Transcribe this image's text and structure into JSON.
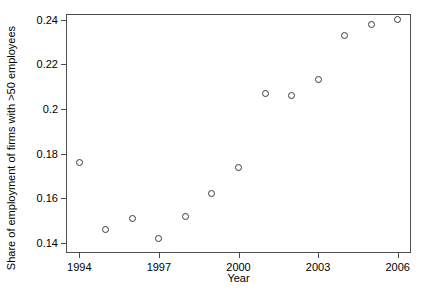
{
  "chart_data": {
    "type": "scatter",
    "title": "",
    "xlabel": "Year",
    "ylabel": "Share of employment of firms with >50 employees",
    "x": [
      1994,
      1995,
      1996,
      1997,
      1998,
      1999,
      2000,
      2001,
      2002,
      2003,
      2004,
      2005,
      2006
    ],
    "values": [
      0.176,
      0.146,
      0.151,
      0.142,
      0.152,
      0.162,
      0.174,
      0.207,
      0.206,
      0.213,
      0.233,
      0.238,
      0.24
    ],
    "series": [
      {
        "name": "Share of employment of firms with >50 employees",
        "values": [
          0.176,
          0.146,
          0.151,
          0.142,
          0.152,
          0.162,
          0.174,
          0.207,
          0.206,
          0.213,
          0.233,
          0.238,
          0.24
        ]
      }
    ],
    "xlim": [
      1993.5,
      2006.5
    ],
    "ylim": [
      0.1355,
      0.2425
    ],
    "xticks": [
      1994,
      1997,
      2000,
      2003,
      2006
    ],
    "xtick_labels": [
      "1994",
      "1997",
      "2000",
      "2003",
      "2006"
    ],
    "yticks": [
      0.14,
      0.16,
      0.18,
      0.2,
      0.22,
      0.24
    ],
    "ytick_labels": [
      "0.14",
      "0.16",
      "0.18",
      "0.2",
      "0.22",
      "0.24"
    ],
    "grid": false,
    "legend": false,
    "legend_position": "none",
    "marker": "open-circle",
    "marker_color": "#3a3a3a",
    "frame_color": "#4d4d4d",
    "background_color": "#ffffff"
  }
}
